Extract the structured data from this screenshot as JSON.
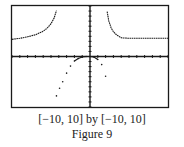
{
  "caption": {
    "window": "[−10, 10] by [−10, 10]",
    "figure": "Figure 9"
  },
  "colors": {
    "ink": "#1a1a1a",
    "background": "#ffffff"
  },
  "chart_data": {
    "type": "line",
    "title": "",
    "xlabel": "",
    "ylabel": "",
    "xlim": [
      -10,
      10
    ],
    "ylim": [
      -10,
      10
    ],
    "xtick_step": 1,
    "ytick_step": 1,
    "grid": false,
    "series": [
      {
        "name": "left-branch",
        "style": "dots-line",
        "x": [
          -10,
          -9,
          -8,
          -7,
          -6,
          -5.5,
          -5,
          -4.6,
          -4.3
        ],
        "y": [
          3.4,
          3.6,
          3.9,
          4.3,
          5.0,
          5.6,
          6.5,
          7.6,
          9.1
        ]
      },
      {
        "name": "middle-branch",
        "style": "dots",
        "x": [
          -4.3,
          -3.9,
          -3.5,
          -3.0,
          -2.5,
          -2.0,
          -1.5,
          -1.0,
          -0.5,
          0,
          0.5,
          1.0,
          1.5,
          2.0
        ],
        "y": [
          -7.8,
          -6.3,
          -5.0,
          -3.3,
          -1.9,
          -0.9,
          -0.4,
          -0.1,
          0,
          0,
          -0.1,
          -0.6,
          -1.6,
          -3.9
        ]
      },
      {
        "name": "right-branch",
        "style": "dots-line",
        "x": [
          2.2,
          2.4,
          2.7,
          3.0,
          3.4,
          4.0,
          5.0,
          6.0,
          7.0,
          8.0,
          9.0,
          10.0
        ],
        "y": [
          8.9,
          7.1,
          5.7,
          4.9,
          4.3,
          3.7,
          3.6,
          3.6,
          3.6,
          3.6,
          3.6,
          3.6
        ]
      }
    ]
  }
}
